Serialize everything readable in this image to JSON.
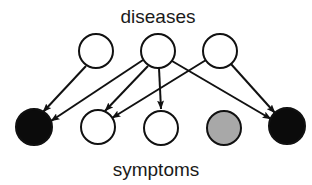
{
  "figure": {
    "type": "bipartite-graph",
    "width": 312,
    "height": 185,
    "background": "#ffffff"
  },
  "labels": {
    "top": "diseases",
    "bottom": "symptoms"
  },
  "label_style": {
    "top": {
      "x": 158,
      "y": 23,
      "font_size": 19
    },
    "bottom": {
      "x": 156,
      "y": 176,
      "font_size": 19
    }
  },
  "colors": {
    "node_stroke": "#111111",
    "node_white": "#ffffff",
    "node_black": "#0b0b0b",
    "node_gray": "#a8a8a8",
    "edge": "#111111",
    "text": "#1a1a1a"
  },
  "nodes": {
    "diseases": [
      {
        "id": "d1",
        "label": "disease-node-1",
        "cx": 96,
        "cy": 51,
        "r": 17,
        "fill": "#ffffff",
        "stroke_width": 2.0
      },
      {
        "id": "d2",
        "label": "disease-node-2",
        "cx": 158,
        "cy": 51,
        "r": 17,
        "fill": "#ffffff",
        "stroke_width": 2.0
      },
      {
        "id": "d3",
        "label": "disease-node-3",
        "cx": 220,
        "cy": 51,
        "r": 17,
        "fill": "#ffffff",
        "stroke_width": 2.0
      }
    ],
    "symptoms": [
      {
        "id": "s1",
        "label": "symptom-node-1",
        "cx": 34,
        "cy": 127,
        "r": 18,
        "fill": "#0b0b0b",
        "stroke_width": 2.0,
        "state": "on"
      },
      {
        "id": "s2",
        "label": "symptom-node-2",
        "cx": 98,
        "cy": 127,
        "r": 17,
        "fill": "#ffffff",
        "stroke_width": 2.0,
        "state": "off"
      },
      {
        "id": "s3",
        "label": "symptom-node-3",
        "cx": 161,
        "cy": 128,
        "r": 17,
        "fill": "#ffffff",
        "stroke_width": 2.0,
        "state": "off"
      },
      {
        "id": "s4",
        "label": "symptom-node-4",
        "cx": 224,
        "cy": 128,
        "r": 17,
        "fill": "#a8a8a8",
        "stroke_width": 2.0,
        "state": "partial"
      },
      {
        "id": "s5",
        "label": "symptom-node-5",
        "cx": 287,
        "cy": 126,
        "r": 18,
        "fill": "#0b0b0b",
        "stroke_width": 2.0,
        "state": "on"
      }
    ]
  },
  "edges": [
    {
      "id": "e1",
      "from": "d1",
      "to": "s1",
      "x1": 86,
      "y1": 66,
      "x2": 43,
      "y2": 112
    },
    {
      "id": "e2",
      "from": "d2",
      "to": "s1",
      "x1": 143,
      "y1": 60,
      "x2": 51,
      "y2": 121
    },
    {
      "id": "e3",
      "from": "d2",
      "to": "s2",
      "x1": 148,
      "y1": 66,
      "x2": 105,
      "y2": 111
    },
    {
      "id": "e4",
      "from": "d2",
      "to": "s3",
      "x1": 159,
      "y1": 68,
      "x2": 161,
      "y2": 109
    },
    {
      "id": "e5",
      "from": "d2",
      "to": "s5",
      "x1": 172,
      "y1": 61,
      "x2": 271,
      "y2": 119
    },
    {
      "id": "e6",
      "from": "d3",
      "to": "s2",
      "x1": 206,
      "y1": 60,
      "x2": 112,
      "y2": 118
    },
    {
      "id": "e7",
      "from": "d3",
      "to": "s5",
      "x1": 231,
      "y1": 64,
      "x2": 275,
      "y2": 113
    }
  ],
  "edge_style": {
    "stroke_width": 2.0,
    "arrowhead": "filled-triangle",
    "arrowhead_length": 9,
    "arrowhead_width": 7
  }
}
